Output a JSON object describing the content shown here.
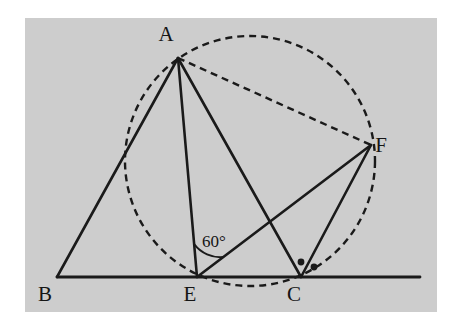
{
  "figure": {
    "page_background": "#ffffff",
    "panel": {
      "fill": "#cdcdcd",
      "x": 25,
      "y": 18,
      "width": 412,
      "height": 294
    },
    "stroke_color": "#1a1a1a",
    "solid_stroke_width": 2.6,
    "dashed_stroke_width": 2.4,
    "dash_pattern": "7,5"
  },
  "points": {
    "A": {
      "label": "A",
      "x": 178,
      "y": 58,
      "label_x": 166,
      "label_y": 41
    },
    "B": {
      "label": "B",
      "x": 57,
      "y": 277,
      "label_x": 45,
      "label_y": 301
    },
    "E": {
      "label": "E",
      "x": 197,
      "y": 277,
      "label_x": 190,
      "label_y": 301
    },
    "C": {
      "label": "C",
      "x": 301,
      "y": 277,
      "label_x": 294,
      "label_y": 301
    },
    "F": {
      "label": "F",
      "x": 371,
      "y": 145,
      "label_x": 381,
      "label_y": 152
    }
  },
  "baseline": {
    "name": "base-line-BC-extended",
    "x1": 57,
    "y1": 277,
    "x2": 420,
    "y2": 277
  },
  "solid_segments": [
    {
      "name": "segment-BA",
      "from": "B",
      "to": "A",
      "x1": 57,
      "y1": 277,
      "x2": 178,
      "y2": 58
    },
    {
      "name": "segment-AE",
      "from": "A",
      "to": "E",
      "x1": 178,
      "y1": 58,
      "x2": 197,
      "y2": 277
    },
    {
      "name": "segment-AC",
      "from": "A",
      "to": "C",
      "x1": 178,
      "y1": 58,
      "x2": 301,
      "y2": 277
    },
    {
      "name": "segment-EF",
      "from": "E",
      "to": "F",
      "x1": 197,
      "y1": 277,
      "x2": 371,
      "y2": 145
    },
    {
      "name": "segment-CF",
      "from": "C",
      "to": "F",
      "x1": 301,
      "y1": 277,
      "x2": 371,
      "y2": 145
    }
  ],
  "dashed_segments": [
    {
      "name": "segment-AF",
      "from": "A",
      "to": "F",
      "x1": 178,
      "y1": 58,
      "x2": 371,
      "y2": 145
    }
  ],
  "circle": {
    "name": "circumcircle-AECF",
    "cx": 250,
    "cy": 161,
    "r": 125,
    "style": "dashed"
  },
  "angle_marks": {
    "at_E": {
      "label": "60°",
      "label_x": 202,
      "label_y": 247,
      "arc_radius": 33,
      "vertex_x": 197,
      "vertex_y": 277
    },
    "at_C": {
      "dots": [
        {
          "name": "angle-dot-ACF",
          "cx": 301,
          "cy": 262,
          "r": 3.4
        },
        {
          "name": "angle-dot-FCX",
          "cx": 314,
          "cy": 267,
          "r": 3.4
        }
      ]
    }
  }
}
